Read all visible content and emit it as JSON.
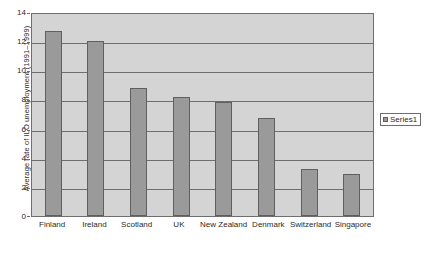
{
  "chart_data": {
    "type": "bar",
    "title": "",
    "xlabel": "",
    "ylabel": "Average rate of ILO unemployment (1991–1999)",
    "categories": [
      "Finland",
      "Ireland",
      "Scotland",
      "UK",
      "New Zealand",
      "Denmark",
      "Switzerland",
      "Singapore"
    ],
    "values": [
      12.7,
      12.0,
      8.8,
      8.15,
      7.85,
      6.7,
      3.2,
      2.85
    ],
    "series": [
      {
        "name": "Series1",
        "values": [
          12.7,
          12.0,
          8.8,
          8.15,
          7.85,
          6.7,
          3.2,
          2.85
        ]
      }
    ],
    "ylim": [
      0,
      14
    ],
    "ytick_values": [
      0,
      2,
      4,
      6,
      8,
      10,
      12,
      14
    ],
    "ytick_labels": [
      "0",
      "2",
      "4",
      "6",
      "8",
      "10",
      "12",
      "14"
    ],
    "grid": "horizontal",
    "legend_position": "right",
    "colors": {
      "bar_fill": "#9a9a9a",
      "bar_border": "#5f5f5f",
      "plot_background": "#d4d4d4",
      "gridline": "#6e6e6e",
      "page_background": "#ffffff",
      "text": "#2b2b2b"
    }
  },
  "legend": {
    "entries": [
      {
        "label": "Series1",
        "swatch_icon": "legend-swatch-icon"
      }
    ]
  }
}
